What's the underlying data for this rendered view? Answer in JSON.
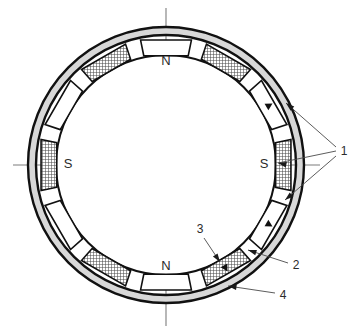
{
  "figure": {
    "background_color": "#ffffff",
    "ink_color": "#111111",
    "axis_color": "#7d7d7d",
    "hatch_color": "#4a4a4a",
    "shell_fill": "#d8d8d8",
    "segment_fill": "#ffffff"
  },
  "geometry": {
    "center_x": 166,
    "center_y": 165,
    "shell_outer_radius": 138,
    "shell_inner_radius": 131,
    "band_outer_radius": 130,
    "band_inner_radius": 110,
    "segment_count": 12,
    "segment_step_deg": 30,
    "segment_half_width_deg": 11.5
  },
  "axes": {
    "vertical": {
      "x": 166,
      "y_top": 8,
      "y_bottom": 326
    },
    "horizontal": {
      "y": 165,
      "x_left": 13,
      "x_right": 320
    }
  },
  "poles": [
    {
      "name": "pole-n-top",
      "text": "N",
      "x": 166,
      "y": 62
    },
    {
      "name": "pole-s-right",
      "text": "S",
      "x": 264,
      "y": 165
    },
    {
      "name": "pole-n-bottom",
      "text": "N",
      "x": 166,
      "y": 267
    },
    {
      "name": "pole-s-left",
      "text": "S",
      "x": 68,
      "y": 165
    }
  ],
  "segments": [
    {
      "angle_deg": 270,
      "style": "plain",
      "pole": "N",
      "arrow": false
    },
    {
      "angle_deg": 300,
      "style": "hatched",
      "pole": "",
      "arrow": false
    },
    {
      "angle_deg": 330,
      "style": "plain",
      "pole": "",
      "arrow": true
    },
    {
      "angle_deg": 0,
      "style": "hatched",
      "pole": "S",
      "arrow": false
    },
    {
      "angle_deg": 30,
      "style": "plain",
      "pole": "",
      "arrow": true
    },
    {
      "angle_deg": 60,
      "style": "hatched",
      "pole": "",
      "arrow": true
    },
    {
      "angle_deg": 90,
      "style": "plain",
      "pole": "N",
      "arrow": false
    },
    {
      "angle_deg": 120,
      "style": "hatched",
      "pole": "",
      "arrow": false
    },
    {
      "angle_deg": 150,
      "style": "plain",
      "pole": "",
      "arrow": false
    },
    {
      "angle_deg": 180,
      "style": "hatched",
      "pole": "S",
      "arrow": false
    },
    {
      "angle_deg": 210,
      "style": "plain",
      "pole": "",
      "arrow": false
    },
    {
      "angle_deg": 240,
      "style": "hatched",
      "pole": "",
      "arrow": false
    }
  ],
  "callouts": [
    {
      "id": "callout-1",
      "text": "1",
      "label_x": 344,
      "label_y": 152,
      "leaders": [
        {
          "x1": 336,
          "y1": 147,
          "x2": 286,
          "y2": 103
        },
        {
          "x1": 336,
          "y1": 151,
          "x2": 278,
          "y2": 163
        },
        {
          "x1": 336,
          "y1": 156,
          "x2": 285,
          "y2": 200
        }
      ],
      "arrow_heads": [
        {
          "x": 286,
          "y": 103,
          "angle_deg": 221
        },
        {
          "x": 278,
          "y": 163,
          "angle_deg": 192
        },
        {
          "x": 285,
          "y": 200,
          "angle_deg": 140
        }
      ]
    },
    {
      "id": "callout-2",
      "text": "2",
      "label_x": 296,
      "label_y": 266,
      "leaders": [
        {
          "x1": 288,
          "y1": 263,
          "x2": 248,
          "y2": 250
        }
      ],
      "arrow_heads": [
        {
          "x": 248,
          "y": 250,
          "angle_deg": 198
        }
      ]
    },
    {
      "id": "callout-3",
      "text": "3",
      "label_x": 200,
      "label_y": 230,
      "leaders": [
        {
          "x1": 204,
          "y1": 238,
          "x2": 220,
          "y2": 262
        }
      ],
      "arrow_heads": [
        {
          "x": 220,
          "y": 262,
          "angle_deg": 56
        }
      ]
    },
    {
      "id": "callout-4",
      "text": "4",
      "label_x": 283,
      "label_y": 296,
      "leaders": [
        {
          "x1": 275,
          "y1": 293,
          "x2": 228,
          "y2": 286
        }
      ],
      "arrow_heads": [
        {
          "x": 228,
          "y": 286,
          "angle_deg": 188
        }
      ]
    }
  ]
}
